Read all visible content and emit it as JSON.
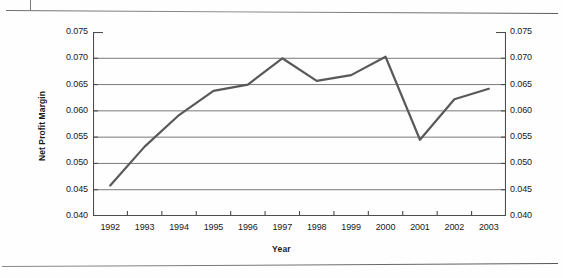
{
  "page": {
    "rule_top": "horizontal-rule",
    "rule_bottom": "horizontal-rule"
  },
  "chart_data": {
    "type": "line",
    "title": "",
    "xlabel": "Year",
    "ylabel": "Net Profit Margin",
    "categories": [
      "1992",
      "1993",
      "1994",
      "1995",
      "1996",
      "1997",
      "1998",
      "1999",
      "2000",
      "2001",
      "2002",
      "2003"
    ],
    "values": [
      0.0458,
      0.0532,
      0.0592,
      0.0638,
      0.065,
      0.07,
      0.0657,
      0.0668,
      0.0703,
      0.0545,
      0.0622,
      0.0642
    ],
    "series": [
      {
        "name": "Net Profit Margin",
        "values": [
          0.0458,
          0.0532,
          0.0592,
          0.0638,
          0.065,
          0.07,
          0.0657,
          0.0668,
          0.0703,
          0.0545,
          0.0622,
          0.0642
        ]
      }
    ],
    "ylim": [
      0.04,
      0.075
    ],
    "ytick_step": 0.005,
    "y_ticks_left": [
      "0.075",
      "0.070",
      "0.065",
      "0.060",
      "0.055",
      "0.050",
      "0.045",
      "0.040"
    ],
    "y_ticks_right": [
      "0.075",
      "0.070",
      "0.065",
      "0.060",
      "0.055",
      "0.050",
      "0.045",
      "0.040"
    ],
    "y_tick_values": [
      0.075,
      0.07,
      0.065,
      0.06,
      0.055,
      0.05,
      0.045,
      0.04
    ],
    "dual_y_axis": true,
    "grid": "horizontal",
    "legend": "none",
    "markers": "none",
    "line_color": "#595959",
    "grid_color": "#7a7a7a",
    "axis_color": "#4d4d4d",
    "line_width": 2.2
  }
}
